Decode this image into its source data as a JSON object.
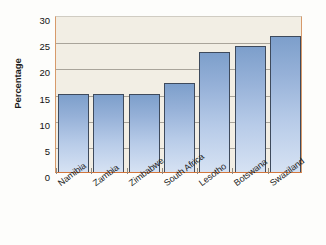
{
  "chart_data": {
    "type": "bar",
    "title": "",
    "subtitle": "",
    "xlabel": "",
    "ylabel": "Percentage",
    "categories": [
      "Namibia",
      "Zambia",
      "Zimbabwe",
      "South Africa",
      "Lesotho",
      "Botswana",
      "Swaziland"
    ],
    "values": [
      15,
      15,
      15,
      17,
      23,
      24,
      26
    ],
    "ylim": [
      0,
      30
    ],
    "yticks": [
      0,
      5,
      10,
      15,
      20,
      25,
      30
    ],
    "ytick_labels": [
      "0",
      "5",
      "10",
      "15",
      "20",
      "25",
      "30"
    ],
    "grid": true,
    "grid_axis": "y",
    "legend": false,
    "legend_position": "none",
    "annotations": []
  },
  "style": {
    "plot_background": "#f2eee4",
    "bar_fill_top": "#7d9fcb",
    "bar_fill_bottom": "#d6e2f3",
    "bar_outline": "#3e4a5c",
    "axis_color": "#d2763c",
    "gridline_color": "#a9a49a",
    "text_color": "#1b1b1b",
    "page_background": "#fdfdfb"
  }
}
